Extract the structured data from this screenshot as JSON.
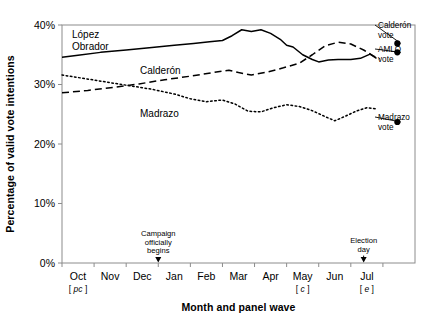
{
  "chart_data": {
    "type": "line",
    "title": "",
    "xlabel": "Month and panel wave",
    "ylabel": "Percentage of valid vote intentions",
    "categories": [
      "Oct",
      "Nov",
      "Dec",
      "Jan",
      "Feb",
      "Mar",
      "Apr",
      "May",
      "Jun",
      "Jul"
    ],
    "x_wave_labels": [
      "pc",
      "",
      "",
      "",
      "",
      "",
      "",
      "c",
      "",
      "e"
    ],
    "xlim": [
      0,
      10
    ],
    "ylim": [
      0,
      40
    ],
    "y_ticks": [
      0,
      10,
      20,
      30,
      40
    ],
    "y_tick_labels": [
      "0%",
      "10%",
      "20%",
      "30%",
      "40%"
    ],
    "grid": false,
    "legend": "inline-labels",
    "series": [
      {
        "name": "López Obrador",
        "style": "solid",
        "points": [
          {
            "x": 0.0,
            "y": 34.6
          },
          {
            "x": 0.5,
            "y": 34.9
          },
          {
            "x": 1.2,
            "y": 35.4
          },
          {
            "x": 2.0,
            "y": 35.8
          },
          {
            "x": 2.8,
            "y": 36.2
          },
          {
            "x": 3.5,
            "y": 36.6
          },
          {
            "x": 4.1,
            "y": 36.9
          },
          {
            "x": 4.6,
            "y": 37.2
          },
          {
            "x": 5.0,
            "y": 37.4
          },
          {
            "x": 5.3,
            "y": 38.2
          },
          {
            "x": 5.6,
            "y": 39.2
          },
          {
            "x": 5.9,
            "y": 38.9
          },
          {
            "x": 6.2,
            "y": 39.2
          },
          {
            "x": 6.5,
            "y": 38.6
          },
          {
            "x": 6.8,
            "y": 37.6
          },
          {
            "x": 7.0,
            "y": 36.6
          },
          {
            "x": 7.2,
            "y": 36.3
          },
          {
            "x": 7.5,
            "y": 35.0
          },
          {
            "x": 7.8,
            "y": 34.2
          },
          {
            "x": 8.0,
            "y": 33.8
          },
          {
            "x": 8.3,
            "y": 34.1
          },
          {
            "x": 8.6,
            "y": 34.2
          },
          {
            "x": 9.0,
            "y": 34.2
          },
          {
            "x": 9.3,
            "y": 34.4
          },
          {
            "x": 9.6,
            "y": 35.1
          },
          {
            "x": 9.8,
            "y": 34.4
          }
        ]
      },
      {
        "name": "Calderón",
        "style": "dashed",
        "points": [
          {
            "x": 0.0,
            "y": 28.6
          },
          {
            "x": 0.8,
            "y": 29.0
          },
          {
            "x": 1.6,
            "y": 29.5
          },
          {
            "x": 2.4,
            "y": 30.1
          },
          {
            "x": 3.2,
            "y": 30.8
          },
          {
            "x": 4.0,
            "y": 31.4
          },
          {
            "x": 4.7,
            "y": 32.0
          },
          {
            "x": 5.2,
            "y": 32.4
          },
          {
            "x": 5.5,
            "y": 32.0
          },
          {
            "x": 5.9,
            "y": 31.6
          },
          {
            "x": 6.4,
            "y": 32.1
          },
          {
            "x": 6.9,
            "y": 32.8
          },
          {
            "x": 7.4,
            "y": 33.6
          },
          {
            "x": 7.8,
            "y": 35.0
          },
          {
            "x": 8.2,
            "y": 36.5
          },
          {
            "x": 8.6,
            "y": 37.1
          },
          {
            "x": 9.0,
            "y": 36.8
          },
          {
            "x": 9.4,
            "y": 35.8
          },
          {
            "x": 9.7,
            "y": 34.8
          },
          {
            "x": 9.9,
            "y": 34.3
          }
        ]
      },
      {
        "name": "Madrazo",
        "style": "dotted",
        "points": [
          {
            "x": 0.0,
            "y": 31.6
          },
          {
            "x": 0.7,
            "y": 31.0
          },
          {
            "x": 1.4,
            "y": 30.4
          },
          {
            "x": 2.1,
            "y": 29.8
          },
          {
            "x": 2.8,
            "y": 29.2
          },
          {
            "x": 3.5,
            "y": 28.4
          },
          {
            "x": 4.0,
            "y": 27.6
          },
          {
            "x": 4.5,
            "y": 27.1
          },
          {
            "x": 5.0,
            "y": 27.4
          },
          {
            "x": 5.4,
            "y": 26.7
          },
          {
            "x": 5.8,
            "y": 25.5
          },
          {
            "x": 6.2,
            "y": 25.4
          },
          {
            "x": 6.6,
            "y": 26.1
          },
          {
            "x": 7.0,
            "y": 26.6
          },
          {
            "x": 7.4,
            "y": 26.3
          },
          {
            "x": 7.8,
            "y": 25.6
          },
          {
            "x": 8.2,
            "y": 24.6
          },
          {
            "x": 8.5,
            "y": 23.9
          },
          {
            "x": 8.8,
            "y": 24.6
          },
          {
            "x": 9.2,
            "y": 25.6
          },
          {
            "x": 9.5,
            "y": 26.1
          },
          {
            "x": 9.8,
            "y": 25.9
          }
        ]
      }
    ],
    "markers": [
      {
        "name": "Calderón vote",
        "x": 10.45,
        "y": 36.9,
        "label": "Calderón\nvote"
      },
      {
        "name": "AMLO vote",
        "x": 10.45,
        "y": 35.4,
        "label": "AMLO\nvote"
      },
      {
        "name": "Madrazo vote",
        "x": 10.45,
        "y": 23.7,
        "label": "Madrazo\nvote"
      }
    ],
    "annotations": [
      {
        "name": "campaign-start",
        "x": 3.0,
        "lines": [
          "Campaign",
          "officially",
          "begins"
        ]
      },
      {
        "name": "election-day",
        "x": 9.4,
        "lines": [
          "Election",
          "day"
        ]
      }
    ]
  },
  "series_labels": {
    "lopez_obrador": [
      "López",
      "Obrador"
    ],
    "calderon": "Calderón",
    "madrazo": "Madrazo"
  },
  "marker_labels": {
    "calderon_vote": [
      "Calderón",
      "vote"
    ],
    "amlo_vote": [
      "AMLO",
      "vote"
    ],
    "madrazo_vote": [
      "Madrazo",
      "vote"
    ]
  },
  "annotation_text": {
    "campaign_1": "Campaign",
    "campaign_2": "officially",
    "campaign_3": "begins",
    "election_1": "Election",
    "election_2": "day"
  },
  "axes": {
    "y_title": "Percentage of valid vote intentions",
    "x_title": "Month and panel wave",
    "y_labels": [
      "40%",
      "30%",
      "20%",
      "10%",
      "0%"
    ],
    "x_labels": [
      "Oct",
      "Nov",
      "Dec",
      "Jan",
      "Feb",
      "Mar",
      "Apr",
      "May",
      "Jun",
      "Jul"
    ],
    "wave_oct": "[ pc ]",
    "wave_may": "[ c ]",
    "wave_jul": "[ e ]"
  },
  "colors": {
    "line": "#000000",
    "axis": "#808080",
    "background": "#ffffff"
  }
}
